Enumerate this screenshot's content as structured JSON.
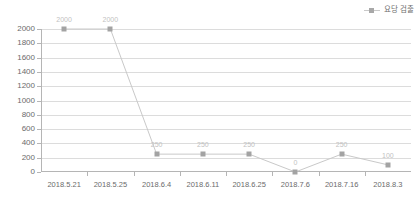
{
  "chart_data": {
    "type": "line",
    "title": "",
    "subtitle": "",
    "xlabel": "",
    "ylabel": "",
    "categories": [
      "2018.5.21",
      "2018.5.25",
      "2018.6.4",
      "2018.6.11",
      "2018.6.25",
      "2018.7.6",
      "2018.7.16",
      "2018.8.3"
    ],
    "series": [
      {
        "name": "요당 검출",
        "values": [
          2000,
          2000,
          250,
          250,
          250,
          0,
          250,
          100
        ]
      }
    ],
    "point_labels": [
      "2000",
      "2000",
      "250",
      "250",
      "250",
      "0",
      "250",
      "100"
    ],
    "ylim": [
      0,
      2000
    ],
    "y_ticks": [
      2000,
      1800,
      1600,
      1400,
      1200,
      1000,
      800,
      600,
      400,
      200,
      0
    ],
    "y_tick_labels": [
      "2000",
      "1800",
      "1600",
      "1400",
      "1200",
      "1000",
      "800",
      "600",
      "400",
      "200",
      "0"
    ],
    "grid": true,
    "legend_position": "top-right",
    "colors": {
      "line": "#c9c9c9",
      "marker": "#a3a3a3",
      "grid": "#dcdcdc",
      "axis": "#b5b5b5",
      "label_text": "#6b6b6b",
      "point_label_text": "#c2c2c2",
      "background": "#ffffff"
    }
  },
  "legend": {
    "items": [
      {
        "label": "요당 검출"
      }
    ]
  }
}
